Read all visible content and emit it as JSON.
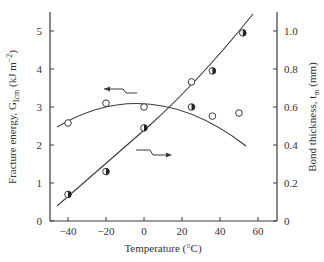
{
  "chart_data": {
    "type": "scatter",
    "title": "",
    "xlabel": "Temperature (°C)",
    "ylabel_left": "Fracture energy, G_Icm (kJ m^-2)",
    "ylabel_right": "Bond thickness, t_m (mm)",
    "xlim": [
      -50,
      70
    ],
    "ylim_left": [
      0,
      5.5
    ],
    "ylim_right": [
      0,
      1.1
    ],
    "x_ticks": [
      -40,
      -20,
      0,
      20,
      40,
      60
    ],
    "y_left_ticks": [
      0,
      1,
      2,
      3,
      4,
      5
    ],
    "y_right_ticks": [
      "0",
      "0.2",
      "0.4",
      "0.6",
      "0.8",
      "1.0"
    ],
    "grid": false,
    "series": [
      {
        "name": "Fracture energy",
        "marker": "open-circle",
        "axis": "left",
        "x": [
          -40,
          -20,
          0,
          25,
          36,
          50
        ],
        "y": [
          2.58,
          3.1,
          3.0,
          3.66,
          2.76,
          2.84
        ],
        "fit": "quadratic curve, peak ~3.4 near 15°C"
      },
      {
        "name": "Bond thickness",
        "marker": "half-filled-circle",
        "axis": "right",
        "x": [
          -40,
          -20,
          0,
          25,
          36,
          52
        ],
        "y": [
          0.14,
          0.26,
          0.49,
          0.6,
          0.79,
          0.99
        ],
        "fit": "roughly linear increasing"
      }
    ],
    "annotations": [
      {
        "type": "arrow-left",
        "points_to": "left axis",
        "near_series": "Fracture energy"
      },
      {
        "type": "arrow-right",
        "points_to": "right axis",
        "near_series": "Bond thickness"
      }
    ]
  },
  "labels": {
    "xlabel": "Temperature (°C)",
    "ylabel_left_main": "Fracture energy, G",
    "ylabel_left_sub": "Icm",
    "ylabel_left_unit": " (kJ m",
    "ylabel_left_exp": "−2",
    "ylabel_left_close": ")",
    "ylabel_right_main": "Bond thickness, t",
    "ylabel_right_sub": "m",
    "ylabel_right_unit": " (mm)"
  }
}
